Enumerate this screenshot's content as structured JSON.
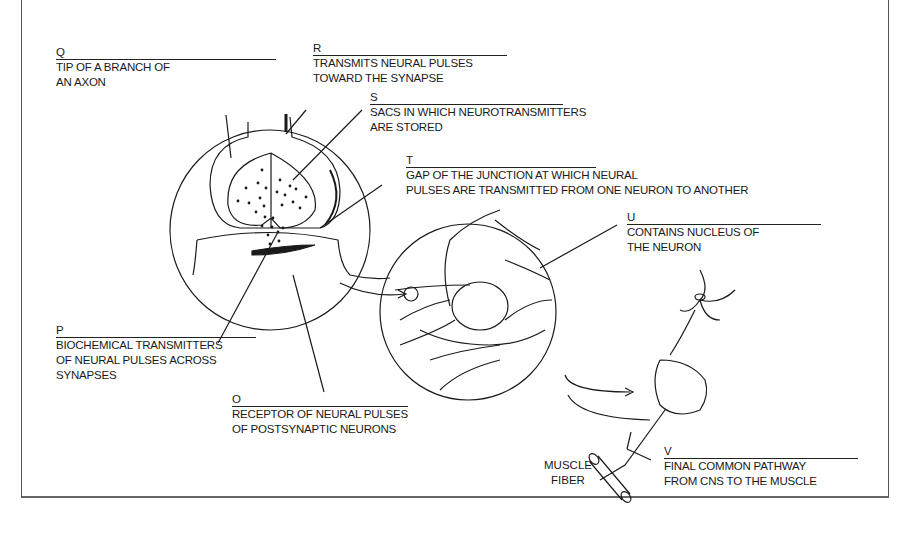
{
  "labels": {
    "q": {
      "letter": "Q",
      "desc": [
        "TIP OF A BRANCH OF",
        "AN AXON"
      ]
    },
    "r": {
      "letter": "R",
      "desc": [
        "TRANSMITS NEURAL PULSES",
        "TOWARD THE SYNAPSE"
      ]
    },
    "s": {
      "letter": "S",
      "desc": [
        "SACS IN WHICH NEUROTRANSMITTERS",
        "ARE STORED"
      ]
    },
    "t": {
      "letter": "T",
      "desc": [
        "GAP OF THE JUNCTION AT WHICH NEURAL",
        "PULSES ARE TRANSMITTED FROM ONE NEURON TO ANOTHER"
      ]
    },
    "u": {
      "letter": "U",
      "desc": [
        "CONTAINS NUCLEUS OF",
        "THE NEURON"
      ]
    },
    "p": {
      "letter": "P",
      "desc": [
        "BIOCHEMICAL TRANSMITTERS",
        "OF NEURAL PULSES ACROSS",
        "SYNAPSES"
      ]
    },
    "o": {
      "letter": "O",
      "desc": [
        "RECEPTOR OF NEURAL PULSES",
        "OF POSTSYNAPTIC NEURONS"
      ]
    },
    "v": {
      "letter": "V",
      "desc": [
        "FINAL COMMON PATHWAY",
        "FROM CNS TO THE MUSCLE"
      ]
    }
  },
  "muscle_fiber": [
    "MUSCLE",
    "FIBER"
  ],
  "colors": {
    "ink": "#1a1a1a",
    "background": "#ffffff"
  }
}
